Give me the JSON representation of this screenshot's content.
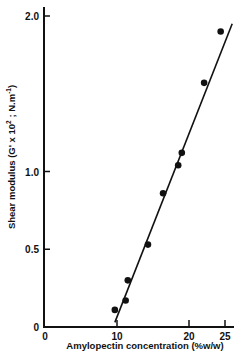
{
  "chart_data": {
    "type": "scatter",
    "title": "",
    "xlabel": "Amylopectin concentration (%w/w)",
    "ylabel": {
      "main": "Shear modulus (G' x 10",
      "exp1": "2",
      "mid": " ; N.m",
      "exp2": "-1",
      "end": ")"
    },
    "ylabel_full": "Shear modulus (G' x 10^2 ; N.m^-1)",
    "xlim": [
      0,
      26
    ],
    "ylim": [
      0,
      2.1
    ],
    "x_ticks": [
      0,
      10,
      20,
      25
    ],
    "x_tick_labels": [
      "0",
      "10",
      "20",
      "25"
    ],
    "y_ticks": [
      0,
      0.5,
      1.0,
      2.0
    ],
    "y_tick_labels": [
      "0",
      "0.5",
      "1.0",
      "2.0"
    ],
    "grid": false,
    "legend": null,
    "series": [
      {
        "name": "measured",
        "marker": "filled-circle",
        "x": [
          9.7,
          11.2,
          11.5,
          14.3,
          16.4,
          18.5,
          19.0,
          22.1,
          24.4
        ],
        "y": [
          0.11,
          0.17,
          0.3,
          0.53,
          0.86,
          1.04,
          1.12,
          1.57,
          1.9
        ]
      }
    ],
    "fit_line": {
      "name": "linear fit",
      "x": [
        9.7,
        26.0
      ],
      "y": [
        0.03,
        1.95
      ]
    }
  },
  "labels": {
    "xlabel": "Amylopectin concentration (%w/w)",
    "ylabel_main": "Shear modulus (G' x 10",
    "ylabel_exp1": "2",
    "ylabel_mid": " ; N.m",
    "ylabel_exp2": "-1",
    "ylabel_end": ")"
  },
  "colors": {
    "ink": "#111111",
    "background": "#ffffff"
  }
}
